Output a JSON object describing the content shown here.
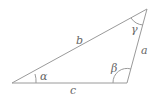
{
  "diagram": {
    "type": "triangle",
    "stroke_color": "#9a9a9a",
    "label_color": "#666666",
    "sides": [
      {
        "label": "a",
        "between": [
          "top",
          "bottom-right"
        ]
      },
      {
        "label": "b",
        "between": [
          "left",
          "top"
        ]
      },
      {
        "label": "c",
        "between": [
          "left",
          "bottom-right"
        ]
      }
    ],
    "angles": [
      {
        "label": "α",
        "vertex": "left"
      },
      {
        "label": "β",
        "vertex": "bottom-right"
      },
      {
        "label": "γ",
        "vertex": "top"
      }
    ]
  }
}
